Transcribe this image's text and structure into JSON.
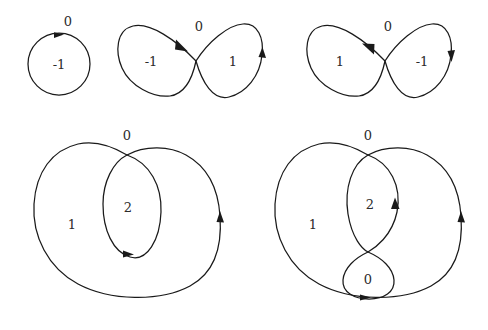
{
  "figure": {
    "background_color": "#ffffff",
    "stroke_color": "#1a1a1a",
    "label_color": "#2b2b2b",
    "diagrams": [
      {
        "id": "circle-clockwise",
        "name": "simple-closed-curve",
        "labels": {
          "outer": "0",
          "inner": "-1"
        }
      },
      {
        "id": "figure-eight-left-negative",
        "name": "figure-eight-curve",
        "labels": {
          "outer": "0",
          "left_lobe": "-1",
          "right_lobe": "1"
        }
      },
      {
        "id": "figure-eight-right-negative",
        "name": "figure-eight-curve",
        "labels": {
          "outer": "0",
          "left_lobe": "1",
          "right_lobe": "-1"
        }
      },
      {
        "id": "loop-in-loop",
        "name": "curve-with-inner-loop",
        "labels": {
          "outer": "0",
          "outer_region": "1",
          "inner_loop": "2"
        }
      },
      {
        "id": "loop-with-figure-eight",
        "name": "curve-with-inner-figure-eight",
        "labels": {
          "outer": "0",
          "outer_region": "1",
          "upper_inner_loop": "2",
          "lower_inner_loop": "0"
        }
      }
    ]
  }
}
